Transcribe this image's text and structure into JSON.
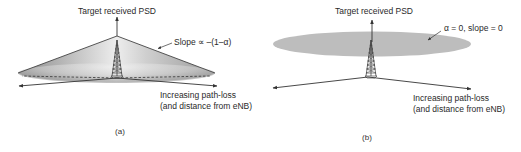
{
  "figure": {
    "panel_a": {
      "caption": "(a)",
      "y_axis_label": "Target received PSD",
      "slope_annotation": "Slope ∝ –(1–α)",
      "x_axis_label_line1": "Increasing path-loss",
      "x_axis_label_line2": "(and distance from eNB)",
      "shape": "cone",
      "icon": "cell-tower-icon"
    },
    "panel_b": {
      "caption": "(b)",
      "y_axis_label": "Target received PSD",
      "slope_annotation": "α = 0, slope = 0",
      "x_axis_label_line1": "Increasing path-loss",
      "x_axis_label_line2": "(and distance from eNB)",
      "shape": "flat-disc",
      "icon": "cell-tower-icon"
    },
    "colors": {
      "line": "#333333",
      "cone_dark": "#8a8a8a",
      "cone_light": "#f2f2f2",
      "disc_fill": "#b9b9b9"
    }
  }
}
